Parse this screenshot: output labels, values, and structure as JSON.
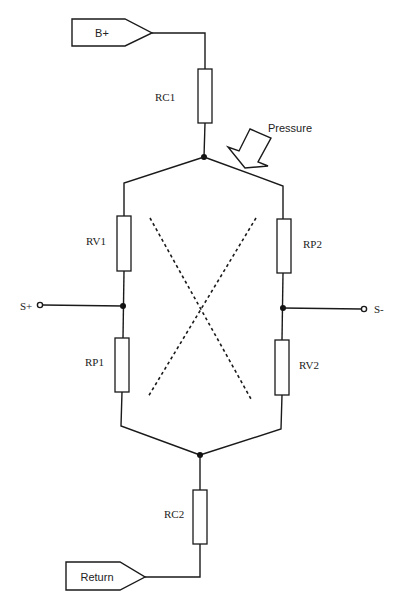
{
  "diagram": {
    "type": "wheatstone-bridge-pressure-sensor",
    "connectors": {
      "supply": {
        "label": "B+"
      },
      "return": {
        "label": "Return"
      }
    },
    "terminals": {
      "positive_output": {
        "label": "S+"
      },
      "negative_output": {
        "label": "S-"
      }
    },
    "resistors": {
      "rc1": {
        "label": "RC1"
      },
      "rc2": {
        "label": "RC2"
      },
      "rv1": {
        "label": "RV1"
      },
      "rp1": {
        "label": "RP1"
      },
      "rp2": {
        "label": "RP2"
      },
      "rv2": {
        "label": "RV2"
      }
    },
    "annotation": {
      "pressure": {
        "label": "Pressure"
      }
    },
    "colors": {
      "line": "#1a1a1a",
      "background": "#ffffff"
    }
  }
}
